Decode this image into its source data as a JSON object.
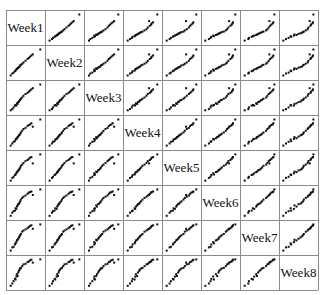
{
  "chart_data": {
    "type": "scatter",
    "subtype": "scatterplot-matrix",
    "title": "",
    "variables": [
      "Week1",
      "Week2",
      "Week3",
      "Week4",
      "Week5",
      "Week6",
      "Week7",
      "Week8"
    ],
    "grid": true,
    "axes_ticks": "none",
    "n_points_per_panel": 22,
    "subjects": [
      [
        0.05,
        0.05,
        0.06,
        0.05,
        0.05,
        0.04,
        0.05,
        0.04
      ],
      [
        0.1,
        0.12,
        0.1,
        0.12,
        0.14,
        0.15,
        0.16,
        0.12
      ],
      [
        0.14,
        0.15,
        0.16,
        0.18,
        0.18,
        0.2,
        0.18,
        0.2
      ],
      [
        0.18,
        0.2,
        0.22,
        0.2,
        0.24,
        0.22,
        0.26,
        0.28
      ],
      [
        0.2,
        0.22,
        0.24,
        0.26,
        0.26,
        0.3,
        0.3,
        0.26
      ],
      [
        0.22,
        0.26,
        0.22,
        0.28,
        0.3,
        0.28,
        0.34,
        0.36
      ],
      [
        0.24,
        0.28,
        0.3,
        0.3,
        0.34,
        0.36,
        0.4,
        0.44
      ],
      [
        0.26,
        0.3,
        0.28,
        0.34,
        0.36,
        0.4,
        0.42,
        0.38
      ],
      [
        0.28,
        0.32,
        0.34,
        0.36,
        0.4,
        0.44,
        0.46,
        0.5
      ],
      [
        0.3,
        0.34,
        0.36,
        0.4,
        0.42,
        0.46,
        0.5,
        0.56
      ],
      [
        0.32,
        0.36,
        0.4,
        0.42,
        0.46,
        0.5,
        0.54,
        0.6
      ],
      [
        0.34,
        0.4,
        0.42,
        0.46,
        0.5,
        0.54,
        0.58,
        0.64
      ],
      [
        0.36,
        0.42,
        0.46,
        0.5,
        0.56,
        0.6,
        0.62,
        0.66
      ],
      [
        0.4,
        0.46,
        0.5,
        0.56,
        0.6,
        0.66,
        0.7,
        0.72
      ],
      [
        0.44,
        0.5,
        0.56,
        0.62,
        0.66,
        0.7,
        0.74,
        0.78
      ],
      [
        0.5,
        0.56,
        0.62,
        0.66,
        0.72,
        0.74,
        0.78,
        0.8
      ],
      [
        0.56,
        0.62,
        0.66,
        0.72,
        0.76,
        0.8,
        0.82,
        0.86
      ],
      [
        0.6,
        0.66,
        0.7,
        0.76,
        0.8,
        0.84,
        0.86,
        0.88
      ],
      [
        0.64,
        0.7,
        0.74,
        0.78,
        0.84,
        0.86,
        0.9,
        0.92
      ],
      [
        0.68,
        0.74,
        0.78,
        0.82,
        0.86,
        0.88,
        0.92,
        0.94
      ],
      [
        0.72,
        0.78,
        0.82,
        0.7,
        0.64,
        0.76,
        0.8,
        0.84
      ],
      [
        0.95,
        0.95,
        0.95,
        0.95,
        0.95,
        0.95,
        0.95,
        0.95
      ]
    ],
    "colors": {
      "points": "#111111",
      "grid": "#8a8a8a",
      "background": "#ffffff"
    }
  },
  "matrix": {
    "n": 8,
    "cell_width": 39,
    "cell_height": 35,
    "diagonal_labels": [
      "Week1",
      "Week2",
      "Week3",
      "Week4",
      "Week5",
      "Week6",
      "Week7",
      "Week8"
    ]
  }
}
